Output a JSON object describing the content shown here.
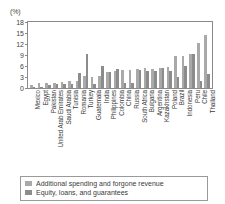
{
  "chart_data": {
    "type": "bar",
    "title": "",
    "subtitle": "",
    "unit_label": "(%)",
    "xlabel": "",
    "ylabel": "",
    "ylim": [
      0,
      18
    ],
    "yticks": [
      18,
      15,
      12,
      9,
      6,
      3,
      0
    ],
    "grid": false,
    "legend_position": "bottom",
    "categories": [
      "Mexico",
      "Egypt",
      "Pakistan",
      "United Arab Emirates",
      "Saudi Arabia",
      "Tunisia",
      "Romania",
      "Turkey",
      "Guatemala",
      "India",
      "Philippines",
      "Colombia",
      "China",
      "Russia",
      "South Africa",
      "Bulgaria",
      "Argentina",
      "Kazakhstan",
      "Poland",
      "Brazil",
      "Indonesia",
      "Peru",
      "Chile",
      "Thailand"
    ],
    "series": [
      {
        "name": "Additional spending and forgone revenue",
        "color": "#a9a9a9",
        "values": [
          0.7,
          1.4,
          1.3,
          1.5,
          1.7,
          1.8,
          2.0,
          3.3,
          3.1,
          3.4,
          4.5,
          4.7,
          4.8,
          5.0,
          5.2,
          5.4,
          5.3,
          5.5,
          5.6,
          8.8,
          8.8,
          9.4,
          12.4,
          14.4
        ]
      },
      {
        "name": "Equity, loans, and guarantees",
        "color": "#8c8c8c",
        "values": [
          0.3,
          0.1,
          0.9,
          1.0,
          1.1,
          1.0,
          4.0,
          9.4,
          1.2,
          5.9,
          4.3,
          5.3,
          1.3,
          1.5,
          5.0,
          4.6,
          4.7,
          5.5,
          4.7,
          3.1,
          5.9,
          9.4,
          2.0,
          3.9
        ]
      }
    ]
  },
  "legend": {
    "items": [
      {
        "label": "Additional spending and forgone revenue",
        "swatch": "spend"
      },
      {
        "label": "Equity, loans, and guarantees",
        "swatch": "equity"
      }
    ]
  }
}
